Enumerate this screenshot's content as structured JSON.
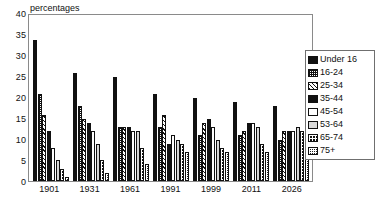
{
  "chart_data": {
    "type": "bar",
    "title": "",
    "subtitle": "",
    "xlabel": "",
    "ylabel": "percentages",
    "ylim": [
      0,
      40
    ],
    "ytick_step": 5,
    "yticks": [
      "40",
      "35",
      "30",
      "25",
      "20",
      "15",
      "10",
      "5",
      "0"
    ],
    "grid": false,
    "legend_position": "right",
    "categories": [
      "1901",
      "1931",
      "1961",
      "1991",
      "1999",
      "2011",
      "2026"
    ],
    "series": [
      {
        "name": "Under 16",
        "values": [
          34,
          26,
          25,
          21,
          20,
          19,
          18
        ]
      },
      {
        "name": "16-24",
        "values": [
          21,
          18,
          13,
          13,
          11,
          11,
          10
        ]
      },
      {
        "name": "25-34",
        "values": [
          16,
          15,
          13,
          16,
          14,
          12,
          12
        ]
      },
      {
        "name": "35-44",
        "values": [
          12,
          14,
          13,
          9,
          15,
          14,
          12
        ]
      },
      {
        "name": "45-54",
        "values": [
          8,
          12,
          12,
          11,
          13,
          14,
          12
        ]
      },
      {
        "name": "53-64",
        "values": [
          5,
          9,
          12,
          10,
          10,
          13,
          13
        ]
      },
      {
        "name": "65-74",
        "values": [
          3,
          5,
          8,
          9,
          8,
          9,
          12
        ]
      },
      {
        "name": "75+",
        "values": [
          1,
          2,
          4,
          7,
          7,
          7,
          11
        ]
      }
    ]
  },
  "legend": {
    "items": [
      {
        "label": "Under 16",
        "swatch": "solid-black-swatch"
      },
      {
        "label": "16-24",
        "swatch": "fine-grid-swatch"
      },
      {
        "label": "25-34",
        "swatch": "diagonal-hatch-swatch"
      },
      {
        "label": "35-44",
        "swatch": "solid-black-swatch"
      },
      {
        "label": "45-54",
        "swatch": "white-swatch"
      },
      {
        "label": "53-64",
        "swatch": "light-grey-swatch"
      },
      {
        "label": "65-74",
        "swatch": "coarse-checker-swatch"
      },
      {
        "label": "75+",
        "swatch": "dense-dotted-swatch"
      }
    ]
  },
  "colors": {
    "bar_dark": "#111111",
    "bar_light": "#d9d9d9",
    "frame": "#8a8a8a",
    "legend_border": "#6f6f6f",
    "background": "#ffffff",
    "text": "#111111"
  }
}
